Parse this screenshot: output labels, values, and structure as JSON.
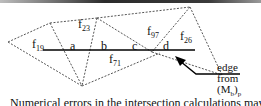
{
  "figure": {
    "faces": [
      {
        "id": "f19",
        "base": "f",
        "sub": "19"
      },
      {
        "id": "f23",
        "base": "f",
        "sub": "23"
      },
      {
        "id": "f97",
        "base": "f",
        "sub": "97"
      },
      {
        "id": "f26",
        "base": "f",
        "sub": "26"
      },
      {
        "id": "f71",
        "base": "f",
        "sub": "71"
      }
    ],
    "intersection_points": [
      "a",
      "b",
      "c",
      "d"
    ],
    "edge_label": {
      "line1": "edge",
      "line2": "from",
      "line3_base": "(M",
      "line3_sub1": "b",
      "line3_close": ")",
      "line3_sub2": "p"
    },
    "caption": "Numerical errors in the intersection calculations may",
    "colors": {
      "mesh_dashed": "#555555",
      "edge_solid": "#000000",
      "text": "#111111"
    }
  }
}
